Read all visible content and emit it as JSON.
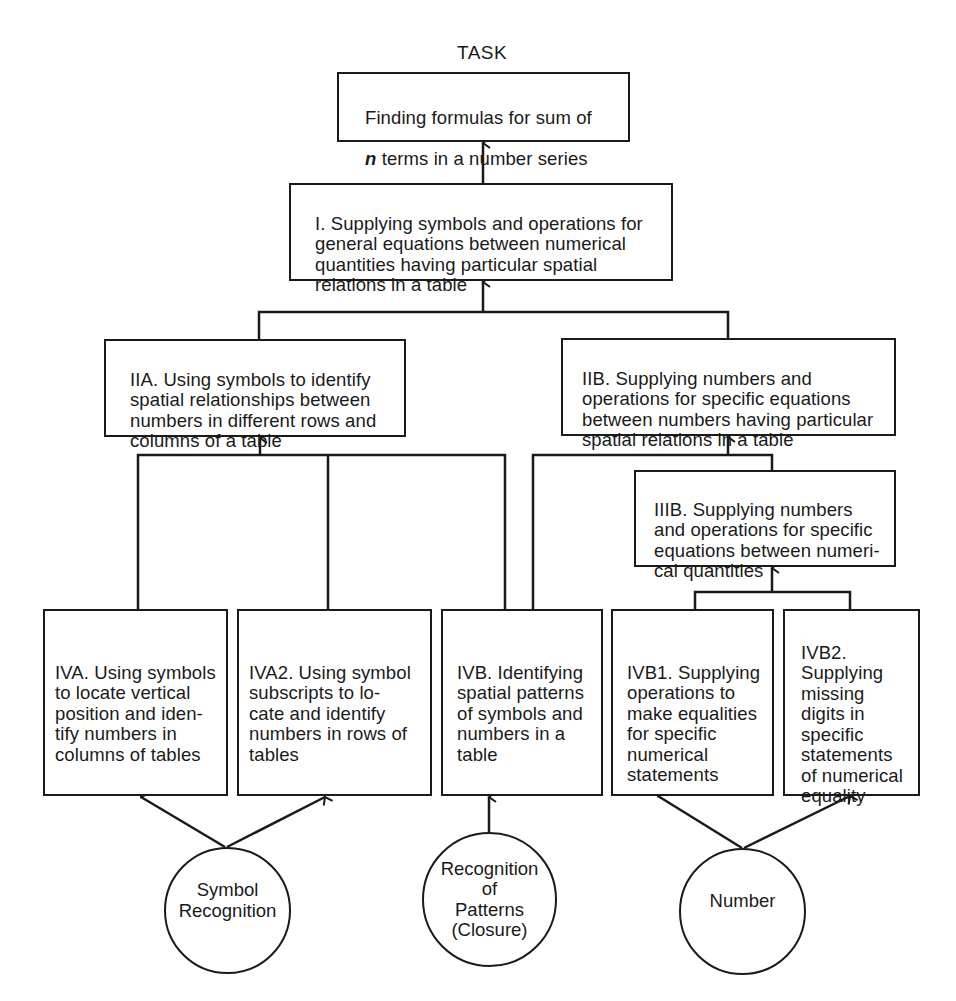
{
  "header": {
    "title": "TASK"
  },
  "task_box": {
    "variable": "n",
    "line1": "Finding formulas for sum of",
    "line2_rest": " terms in a number series"
  },
  "boxes": {
    "I": "I. Supplying symbols and operations for\ngeneral equations between numerical\nquantities having particular spatial\nrelations in a table",
    "IIA": "IIA. Using symbols to identify\nspatial relationships between\nnumbers in different rows and\ncolumns of a table",
    "IIB": "IIB. Supplying numbers and\noperations for specific equations\nbetween numbers having particular\nspatial relations in a table",
    "IIIB": "IIIB. Supplying numbers\nand operations for specific\nequations between numeri-\ncal quantities",
    "IVA": "IVA. Using symbols\nto locate vertical\nposition and iden-\ntify numbers in\ncolumns of tables",
    "IVA2": "IVA2. Using symbol\nsubscripts to lo-\ncate and identify\nnumbers in rows of\ntables",
    "IVB": "IVB. Identifying\nspatial patterns\nof symbols and\nnumbers in a\ntable",
    "IVB1": "IVB1. Supplying\noperations to\nmake equalities\nfor specific\nnumerical\nstatements",
    "IVB2": "IVB2.\nSupplying\nmissing\ndigits in\nspecific\nstatements\nof numerical\nequality"
  },
  "abilities": {
    "symbol": "Symbol\nRecognition",
    "patterns": "Recognition\nof\nPatterns\n(Closure)",
    "number": "Number"
  },
  "colors": {
    "ink": "#1a1a1a",
    "paper": "#ffffff"
  }
}
